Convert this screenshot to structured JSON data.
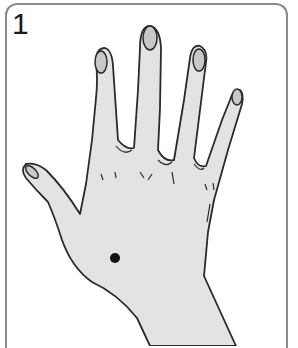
{
  "figure": {
    "step_number": "1",
    "marker": "acupressure-point-dot",
    "colors": {
      "skin_fill": "#e3e3e3",
      "nail_fill": "#c8c8c8",
      "outline": "#2a2a2a",
      "marker": "#111111",
      "border": "#8a8a8a"
    }
  }
}
